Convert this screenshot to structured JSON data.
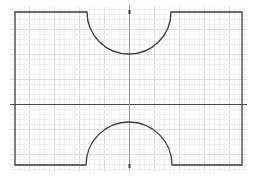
{
  "diagram": {
    "type": "cad-sketch",
    "colors": {
      "background": "#ffffff",
      "grid_minor": "#efefef",
      "grid_major": "#dcdcdc",
      "outline": "#3a3a3a",
      "axis": "#4a4a4a"
    },
    "grid": {
      "minor_spacing_px": 5,
      "major_spacing_px": 25,
      "extent": {
        "x0": 10,
        "y0": 7,
        "x1": 247,
        "y1": 172
      }
    },
    "axes": {
      "origin": {
        "x": 129,
        "y": 104
      },
      "horizontal": {
        "x0": 10,
        "x1": 247
      },
      "vertical": {
        "y0": 5,
        "y1": 170
      }
    },
    "shape": {
      "rect": {
        "left": 15,
        "top": 12,
        "right": 242,
        "bottom": 165
      },
      "top_cutout": {
        "cx": 129,
        "cy": 12,
        "r": 42
      },
      "bottom_cutout": {
        "cx": 129,
        "cy": 165,
        "r": 43
      }
    }
  }
}
